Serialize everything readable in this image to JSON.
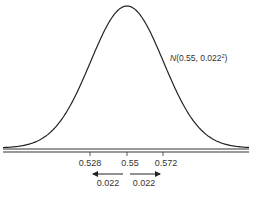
{
  "chart_data": {
    "type": "line",
    "title": "",
    "distribution": "normal",
    "mean": 0.55,
    "sd": 0.022,
    "curve_label": {
      "prefix": "N",
      "body": "(0.55, 0.022",
      "exponent": "2",
      "suffix": ")"
    },
    "xlabel": "",
    "ylabel": "",
    "x_ticks": [
      "0.528",
      "0.55",
      "0.572"
    ],
    "x_tick_values": [
      0.528,
      0.55,
      0.572
    ],
    "annotations": [
      {
        "type": "arrow-left",
        "from": 0.55,
        "to": 0.528,
        "label": "0.022"
      },
      {
        "type": "arrow-right",
        "from": 0.55,
        "to": 0.572,
        "label": "0.022"
      }
    ],
    "grid": false,
    "legend": null,
    "xlim": [
      0.4775,
      0.6225
    ]
  },
  "colors": {
    "curve": "#222222",
    "axis": "#333333",
    "text": "#333333"
  }
}
